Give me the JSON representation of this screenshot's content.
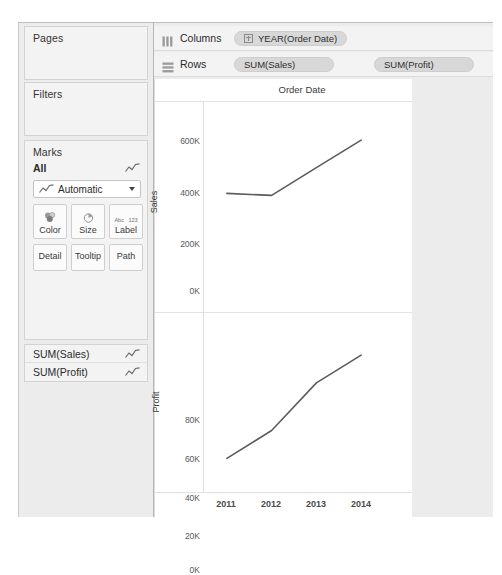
{
  "cards": {
    "pages": {
      "title": "Pages"
    },
    "filters": {
      "title": "Filters"
    },
    "marks": {
      "title": "Marks",
      "all_label": "All",
      "all_icon": "line-chart-icon",
      "mark_type": {
        "value": "Automatic",
        "icon": "line-chart-icon",
        "caret": "chevron-down-icon"
      },
      "buttons": [
        {
          "label": "Color",
          "icon": "color-circles-icon"
        },
        {
          "label": "Size",
          "icon": "size-circle-icon"
        },
        {
          "label": "Label",
          "icon": "abc-123-icon",
          "icon_top": "Abc",
          "icon_bottom": "123"
        },
        {
          "label": "Detail",
          "icon": "detail-icon"
        },
        {
          "label": "Tooltip",
          "icon": "tooltip-icon"
        },
        {
          "label": "Path",
          "icon": "path-icon"
        }
      ]
    },
    "measures": [
      {
        "label": "SUM(Sales)",
        "icon": "line-chart-icon"
      },
      {
        "label": "SUM(Profit)",
        "icon": "line-chart-icon"
      }
    ]
  },
  "shelves": {
    "columns": {
      "name": "Columns",
      "icon": "columns-icon",
      "pills": [
        {
          "text": "YEAR(Order Date)",
          "expand_icon": "plus-box-icon",
          "has_expand": true
        }
      ]
    },
    "rows": {
      "name": "Rows",
      "icon": "rows-icon",
      "pills": [
        {
          "text": "SUM(Sales)",
          "has_expand": false
        },
        {
          "text": "SUM(Profit)",
          "has_expand": false
        }
      ]
    }
  },
  "viz": {
    "title": "Order Date"
  },
  "chart_data": [
    {
      "type": "line",
      "title": "Order Date",
      "ylabel": "Sales",
      "xlabel": "",
      "categories": [
        "2011",
        "2012",
        "2013",
        "2014"
      ],
      "values": [
        480000,
        470000,
        608000,
        745000
      ],
      "ytick_labels": [
        "600K",
        "400K",
        "200K",
        "0K"
      ],
      "ytick_values": [
        600000,
        400000,
        200000,
        0
      ],
      "ylim": [
        0,
        800000
      ],
      "grid": false,
      "legend": "none",
      "line_color": "#5c5c5c"
    },
    {
      "type": "line",
      "title": "",
      "ylabel": "Profit",
      "xlabel": "",
      "categories": [
        "2011",
        "2012",
        "2013",
        "2014"
      ],
      "values": [
        49000,
        61000,
        81500,
        93500
      ],
      "ytick_labels": [
        "80K",
        "60K",
        "40K",
        "20K",
        "0K"
      ],
      "ytick_values": [
        80000,
        60000,
        40000,
        20000,
        0
      ],
      "ylim": [
        0,
        100000
      ],
      "grid": false,
      "legend": "none",
      "line_color": "#5c5c5c"
    }
  ],
  "x_axis": {
    "ticks": [
      "2011",
      "2012",
      "2013",
      "2014"
    ]
  }
}
